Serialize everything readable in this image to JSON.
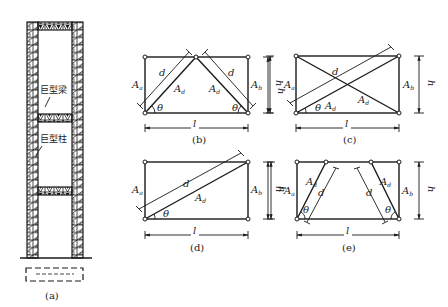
{
  "figure": {
    "panel_a": {
      "caption": "(a)",
      "mega_beam_label": "巨型梁",
      "mega_column_label": "巨型柱"
    },
    "panel_b": {
      "caption": "(b)",
      "column_left": "A",
      "column_left_sub": "a",
      "column_right": "A",
      "column_right_sub": "b",
      "brace_area": "A",
      "brace_area_sub": "d",
      "brace_length": "d",
      "angle": "θ",
      "width": "l",
      "height": "h"
    },
    "panel_c": {
      "caption": "(c)",
      "column_left": "A",
      "column_left_sub": "a",
      "column_right": "A",
      "column_right_sub": "b",
      "brace_area": "A",
      "brace_area_sub": "d",
      "brace_length": "d",
      "angle": "θ",
      "width": "l",
      "height": "h"
    },
    "panel_d": {
      "caption": "(d)",
      "column_left": "A",
      "column_left_sub": "a",
      "column_right": "A",
      "column_right_sub": "b",
      "brace_area": "A",
      "brace_area_sub": "d",
      "brace_length": "d",
      "angle": "θ",
      "width": "l",
      "height": "h"
    },
    "panel_e": {
      "caption": "(e)",
      "column_left": "A",
      "column_left_sub": "a",
      "column_right": "A",
      "column_right_sub": "b",
      "brace_area": "A",
      "brace_area_sub": "d",
      "brace_length": "d",
      "angle": "θ",
      "width": "l",
      "height": "h"
    }
  }
}
